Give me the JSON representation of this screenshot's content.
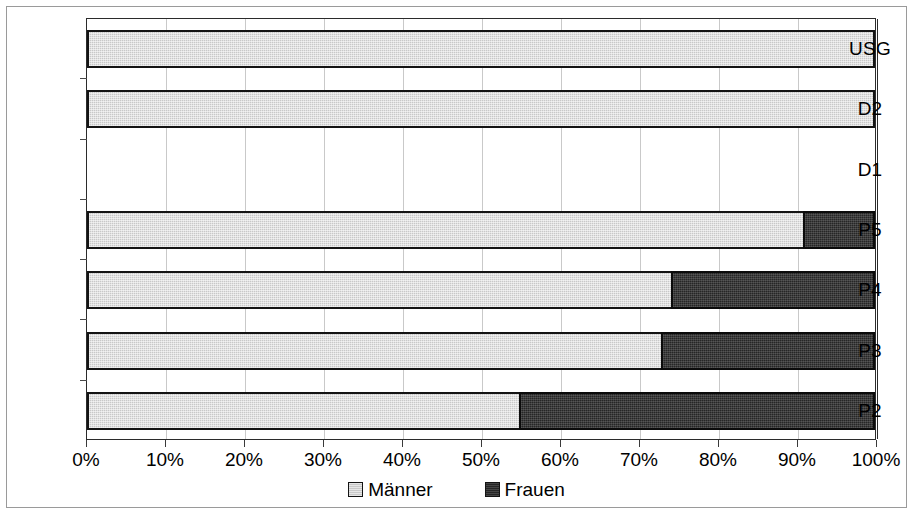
{
  "chart_data": {
    "type": "bar",
    "orientation": "horizontal",
    "stacked": true,
    "normalized_percent": true,
    "title": "",
    "subtitle": "",
    "xlabel": "",
    "ylabel": "",
    "xlim": [
      0,
      100
    ],
    "xticks": [
      "0%",
      "10%",
      "20%",
      "30%",
      "40%",
      "50%",
      "60%",
      "70%",
      "80%",
      "90%",
      "100%"
    ],
    "xtick_values": [
      0,
      10,
      20,
      30,
      40,
      50,
      60,
      70,
      80,
      90,
      100
    ],
    "grid": "vertical",
    "legend_position": "bottom-center",
    "categories": [
      "USG",
      "D2",
      "D1",
      "P5",
      "P4",
      "P3",
      "P2"
    ],
    "series": [
      {
        "name": "Männer",
        "color": "#c8c8c8",
        "values": [
          100,
          100,
          0,
          90.9,
          74.2,
          72.9,
          54.9
        ]
      },
      {
        "name": "Frauen",
        "color": "#262626",
        "values": [
          0,
          0,
          0,
          9.1,
          25.8,
          27.1,
          45.1
        ]
      }
    ]
  },
  "legend": {
    "items": [
      {
        "label": "Männer",
        "swatch": "maenner"
      },
      {
        "label": "Frauen",
        "swatch": "frauen"
      }
    ]
  },
  "colors": {
    "maenner": "#c8c8c8",
    "frauen": "#262626",
    "grid": "#c9c9c9",
    "axis": "#2b2b2b",
    "frame": "#9a9a9a",
    "background": "#ffffff"
  }
}
